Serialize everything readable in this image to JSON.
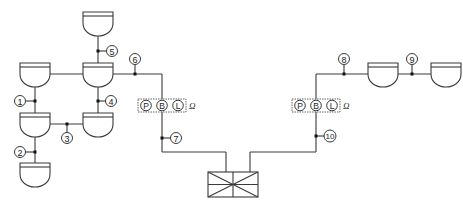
{
  "diagram": {
    "type": "network-topology",
    "colors": {
      "line": "#3a3a3a",
      "background": "#ffffff",
      "junction": "#111111"
    },
    "units": [
      {
        "id": "u-top",
        "x": 98,
        "y": 12
      },
      {
        "id": "u-hub",
        "x": 98,
        "y": 63
      },
      {
        "id": "u-left-top",
        "x": 35,
        "y": 63
      },
      {
        "id": "u-left-mid",
        "x": 35,
        "y": 113
      },
      {
        "id": "u-right-mid",
        "x": 98,
        "y": 113
      },
      {
        "id": "u-left-bot",
        "x": 35,
        "y": 163
      },
      {
        "id": "u-r1",
        "x": 383,
        "y": 63
      },
      {
        "id": "u-r2",
        "x": 446,
        "y": 63
      }
    ],
    "labels": [
      {
        "id": "n1",
        "text": "1",
        "x": 20,
        "y": 101
      },
      {
        "id": "n2",
        "text": "2",
        "x": 20,
        "y": 152
      },
      {
        "id": "n3",
        "text": "3",
        "x": 67,
        "y": 138
      },
      {
        "id": "n4",
        "text": "4",
        "x": 111,
        "y": 101
      },
      {
        "id": "n5",
        "text": "5",
        "x": 112,
        "y": 51
      },
      {
        "id": "n6",
        "text": "6",
        "x": 135,
        "y": 59
      },
      {
        "id": "n7",
        "text": "7",
        "x": 176,
        "y": 138
      },
      {
        "id": "n8",
        "text": "8",
        "x": 344,
        "y": 59
      },
      {
        "id": "n9",
        "text": "9",
        "x": 412,
        "y": 59
      },
      {
        "id": "n10",
        "text": "10",
        "x": 330,
        "y": 136
      }
    ],
    "pbl_groups": [
      {
        "id": "pbl-left",
        "x": 138,
        "y": 99,
        "letters": [
          "P",
          "B",
          "L"
        ],
        "suffix": "Ω"
      },
      {
        "id": "pbl-right",
        "x": 296,
        "y": 99,
        "letters": [
          "P",
          "B",
          "L"
        ],
        "suffix": "Ω"
      }
    ],
    "central_box": {
      "x": 208,
      "y": 172,
      "w": 50,
      "h": 25
    }
  }
}
